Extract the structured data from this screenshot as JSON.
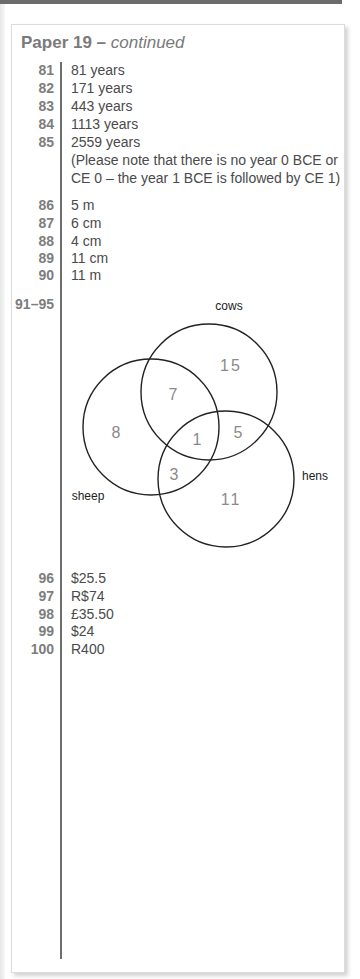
{
  "header": {
    "title_main": "Paper 19 – ",
    "title_cont": "continued"
  },
  "answers_a": [
    {
      "num": "81",
      "text": "81 years"
    },
    {
      "num": "82",
      "text": "171 years"
    },
    {
      "num": "83",
      "text": "443 years"
    },
    {
      "num": "84",
      "text": "1113 years"
    },
    {
      "num": "85",
      "text": "2559 years"
    }
  ],
  "note": {
    "line1": "(Please note that there is no year 0 BCE or",
    "line2": "CE 0 – the year 1 BCE is followed by CE 1)"
  },
  "answers_b": [
    {
      "num": "86",
      "text": "5 m"
    },
    {
      "num": "87",
      "text": "6 cm"
    },
    {
      "num": "88",
      "text": "4 cm"
    },
    {
      "num": "89",
      "text": "11 cm"
    },
    {
      "num": "90",
      "text": "11 m"
    }
  ],
  "venn_question": {
    "num": "91–95",
    "sets": {
      "cows": "cows",
      "sheep": "sheep",
      "hens": "hens"
    },
    "regions": {
      "cows_only": "15",
      "sheep_only": "8",
      "hens_only": "11",
      "cows_sheep": "7",
      "cows_hens": "5",
      "sheep_hens": "3",
      "all_three": "1"
    }
  },
  "answers_c": [
    {
      "num": "96",
      "text": "$25.5"
    },
    {
      "num": "97",
      "text": "R$74"
    },
    {
      "num": "98",
      "text": "£35.50"
    },
    {
      "num": "99",
      "text": "$24"
    },
    {
      "num": "100",
      "text": "R400"
    }
  ],
  "colors": {
    "number_gray": "#7d7d7d",
    "answer_text": "#4a4a4a",
    "venn_number": "#8a8a8a",
    "circle_stroke": "#222222"
  }
}
